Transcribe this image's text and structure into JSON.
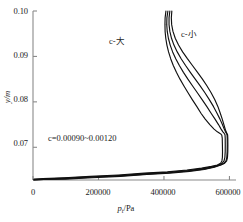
{
  "figure": {
    "background_color": "#ffffff",
    "line_color": "#111111",
    "axis_color": "#8a8a8a"
  },
  "axes": {
    "x_label": "p",
    "x_label_sub": "t",
    "x_label_unit": "/Pa",
    "y_label": "y/m",
    "x_ticks": [
      "0",
      "200000",
      "400000",
      "600000"
    ],
    "x_tick_values": [
      0,
      200000,
      400000,
      600000
    ],
    "y_ticks": [
      "0.07",
      "0.08",
      "0.09",
      "0.10"
    ],
    "y_tick_values": [
      0.07,
      0.08,
      0.09,
      0.1
    ],
    "xlim": [
      0,
      620000
    ],
    "ylim": [
      0.0628,
      0.1
    ],
    "grid": false
  },
  "annotations": {
    "c_range": "c=0.00090~0.00120",
    "c_large": "c-大",
    "c_small": "c-小"
  },
  "chart_data": {
    "type": "line",
    "title": "",
    "xlabel": "p_t/Pa",
    "ylabel": "y/m",
    "xlim": [
      0,
      620000
    ],
    "ylim": [
      0.0628,
      0.1
    ],
    "grid": false,
    "legend": "inline-annotation",
    "x_ticks": [
      0,
      200000,
      400000,
      600000
    ],
    "y_ticks": [
      0.07,
      0.08,
      0.09,
      0.1
    ],
    "series": [
      {
        "name": "c=0.00090 (c-大)",
        "points": [
          [
            406000,
            0.1
          ],
          [
            403500,
            0.0985
          ],
          [
            403000,
            0.097
          ],
          [
            403500,
            0.0955
          ],
          [
            405500,
            0.094
          ],
          [
            409000,
            0.0925
          ],
          [
            414000,
            0.091
          ],
          [
            420500,
            0.0895
          ],
          [
            428500,
            0.088
          ],
          [
            438000,
            0.0865
          ],
          [
            449000,
            0.085
          ],
          [
            461000,
            0.0835
          ],
          [
            473500,
            0.082
          ],
          [
            486500,
            0.0805
          ],
          [
            500000,
            0.079
          ],
          [
            513000,
            0.0775
          ],
          [
            526000,
            0.0762
          ],
          [
            540000,
            0.075
          ],
          [
            553000,
            0.074
          ],
          [
            563000,
            0.0734
          ],
          [
            570000,
            0.0731
          ],
          [
            574000,
            0.0729
          ],
          [
            576500,
            0.0727
          ],
          [
            578000,
            0.072
          ],
          [
            578500,
            0.0705
          ],
          [
            578800,
            0.069
          ],
          [
            578500,
            0.0678
          ],
          [
            577000,
            0.067
          ],
          [
            573000,
            0.0665
          ],
          [
            563000,
            0.0661
          ],
          [
            545000,
            0.0658
          ],
          [
            515000,
            0.0654
          ],
          [
            470000,
            0.065
          ],
          [
            410000,
            0.0646
          ],
          [
            340000,
            0.0643
          ],
          [
            260000,
            0.0639
          ],
          [
            175000,
            0.0636
          ],
          [
            95000,
            0.0633
          ],
          [
            30000,
            0.0631
          ],
          [
            3000,
            0.063
          ]
        ]
      },
      {
        "name": "c=0.00100",
        "points": [
          [
            412000,
            0.1
          ],
          [
            409000,
            0.0985
          ],
          [
            408500,
            0.097
          ],
          [
            410000,
            0.0955
          ],
          [
            413500,
            0.094
          ],
          [
            419000,
            0.0925
          ],
          [
            426500,
            0.091
          ],
          [
            436000,
            0.0895
          ],
          [
            447000,
            0.088
          ],
          [
            459500,
            0.0865
          ],
          [
            473000,
            0.085
          ],
          [
            487500,
            0.0835
          ],
          [
            502000,
            0.082
          ],
          [
            516500,
            0.0805
          ],
          [
            530500,
            0.079
          ],
          [
            544000,
            0.0775
          ],
          [
            556000,
            0.0762
          ],
          [
            566500,
            0.075
          ],
          [
            574500,
            0.074
          ],
          [
            580000,
            0.0734
          ],
          [
            583500,
            0.0731
          ],
          [
            585500,
            0.0729
          ],
          [
            586500,
            0.0727
          ],
          [
            587000,
            0.072
          ],
          [
            587200,
            0.0705
          ],
          [
            587000,
            0.069
          ],
          [
            586000,
            0.0678
          ],
          [
            583500,
            0.067
          ],
          [
            578000,
            0.0665
          ],
          [
            567000,
            0.0661
          ],
          [
            548000,
            0.0657
          ],
          [
            518000,
            0.0653
          ],
          [
            473000,
            0.0649
          ],
          [
            413000,
            0.0645
          ],
          [
            343000,
            0.0642
          ],
          [
            263000,
            0.0638
          ],
          [
            178000,
            0.0635
          ],
          [
            97000,
            0.0632
          ],
          [
            31000,
            0.063
          ],
          [
            3000,
            0.0629
          ]
        ]
      },
      {
        "name": "c=0.00110",
        "points": [
          [
            418000,
            0.1
          ],
          [
            415500,
            0.0985
          ],
          [
            415500,
            0.097
          ],
          [
            418000,
            0.0955
          ],
          [
            423000,
            0.094
          ],
          [
            430500,
            0.0925
          ],
          [
            440500,
            0.091
          ],
          [
            452500,
            0.0895
          ],
          [
            466000,
            0.088
          ],
          [
            480500,
            0.0865
          ],
          [
            495500,
            0.085
          ],
          [
            510500,
            0.0835
          ],
          [
            525000,
            0.082
          ],
          [
            538500,
            0.0805
          ],
          [
            551000,
            0.079
          ],
          [
            562000,
            0.0775
          ],
          [
            571000,
            0.0762
          ],
          [
            578500,
            0.075
          ],
          [
            584000,
            0.074
          ],
          [
            588000,
            0.0734
          ],
          [
            590500,
            0.0731
          ],
          [
            592000,
            0.0729
          ],
          [
            592800,
            0.0727
          ],
          [
            593200,
            0.072
          ],
          [
            593300,
            0.0705
          ],
          [
            593000,
            0.069
          ],
          [
            592000,
            0.0678
          ],
          [
            589500,
            0.067
          ],
          [
            583500,
            0.0665
          ],
          [
            572000,
            0.0661
          ],
          [
            552000,
            0.0657
          ],
          [
            521000,
            0.0652
          ],
          [
            476000,
            0.0648
          ],
          [
            416000,
            0.0644
          ],
          [
            346000,
            0.0641
          ],
          [
            265000,
            0.0637
          ],
          [
            180000,
            0.0634
          ],
          [
            98000,
            0.0631
          ],
          [
            31500,
            0.0629
          ],
          [
            3000,
            0.0628
          ]
        ]
      },
      {
        "name": "c=0.00120 (c-小)",
        "points": [
          [
            424000,
            0.1
          ],
          [
            422500,
            0.0985
          ],
          [
            423500,
            0.097
          ],
          [
            427500,
            0.0955
          ],
          [
            434500,
            0.094
          ],
          [
            444500,
            0.0925
          ],
          [
            457000,
            0.091
          ],
          [
            471500,
            0.0895
          ],
          [
            487000,
            0.088
          ],
          [
            502500,
            0.0865
          ],
          [
            517500,
            0.085
          ],
          [
            531500,
            0.0835
          ],
          [
            544000,
            0.082
          ],
          [
            555000,
            0.0805
          ],
          [
            564500,
            0.079
          ],
          [
            572000,
            0.0775
          ],
          [
            578000,
            0.0762
          ],
          [
            583000,
            0.075
          ],
          [
            587000,
            0.074
          ],
          [
            590000,
            0.0734
          ],
          [
            592000,
            0.0731
          ],
          [
            593500,
            0.0729
          ],
          [
            594500,
            0.0727
          ],
          [
            595000,
            0.072
          ],
          [
            595200,
            0.0705
          ],
          [
            595000,
            0.069
          ],
          [
            594000,
            0.0678
          ],
          [
            591500,
            0.067
          ],
          [
            585500,
            0.0665
          ],
          [
            574000,
            0.0661
          ],
          [
            554000,
            0.0656
          ],
          [
            523000,
            0.0651
          ],
          [
            478000,
            0.0647
          ],
          [
            418000,
            0.0643
          ],
          [
            348000,
            0.064
          ],
          [
            267000,
            0.0636
          ],
          [
            181000,
            0.0633
          ],
          [
            99000,
            0.063
          ],
          [
            32000,
            0.0629
          ],
          [
            3000,
            0.0628
          ]
        ]
      }
    ]
  }
}
